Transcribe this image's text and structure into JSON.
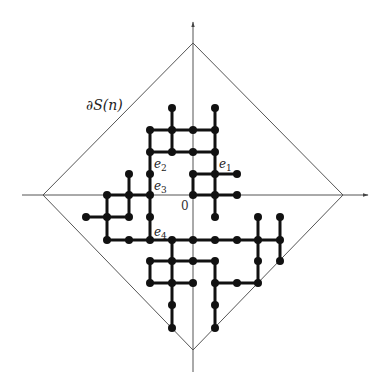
{
  "labels": {
    "boundary": "∂S(n)",
    "origin": "0",
    "e1": "e",
    "e1_sub": "1",
    "e2": "e",
    "e2_sub": "2",
    "e3": "e",
    "e3_sub": "3",
    "e4": "e",
    "e4_sub": "4"
  },
  "grid": {
    "origin_px": [
      193,
      195
    ],
    "spacing_px": 21.5
  },
  "diamond": {
    "top": [
      193,
      43
    ],
    "right": [
      343,
      195
    ],
    "bottom": [
      193,
      350
    ],
    "left": [
      43,
      195
    ]
  },
  "colors": {
    "cluster": "#111111",
    "axes": "#555555",
    "diamond": "#555555"
  }
}
